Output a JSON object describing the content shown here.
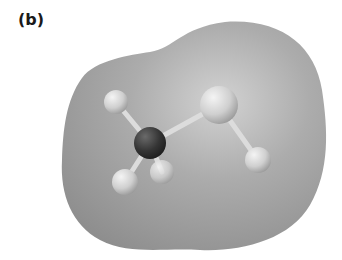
{
  "figure": {
    "panel_label": "(b)",
    "atoms": [
      {
        "id": "H1",
        "element": "H",
        "cx": 116,
        "cy": 102,
        "r": 12
      },
      {
        "id": "C",
        "element": "C",
        "cx": 150,
        "cy": 143,
        "r": 16
      },
      {
        "id": "O",
        "element": "O",
        "cx": 219,
        "cy": 105,
        "r": 19
      },
      {
        "id": "H4",
        "element": "H",
        "cx": 258,
        "cy": 160,
        "r": 13
      },
      {
        "id": "H2",
        "element": "H",
        "cx": 125,
        "cy": 182,
        "r": 13
      },
      {
        "id": "H3",
        "element": "H",
        "cx": 162,
        "cy": 172,
        "r": 12
      }
    ],
    "colors": {
      "surface": "#a8a8a8",
      "carbon": "#3a3a3a",
      "oxygen": "#d8d8d8",
      "hydrogen": "#d0d0d0",
      "bond": "#e0e0e0"
    }
  }
}
